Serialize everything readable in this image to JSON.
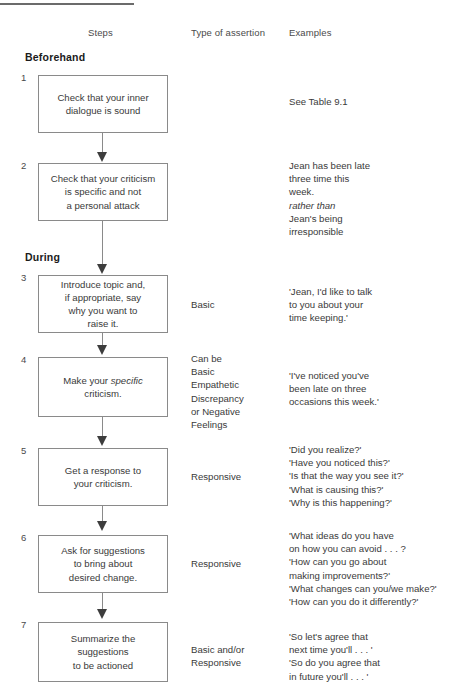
{
  "figure": {
    "columns": {
      "steps": "Steps",
      "type_of_assertion": "Type of assertion",
      "examples": "Examples"
    },
    "phases": {
      "beforehand": "Beforehand",
      "during": "During"
    },
    "steps": [
      {
        "number": "1",
        "box_lines": [
          "Check that your inner",
          "dialogue is sound"
        ],
        "assertion": "",
        "example_lines": [
          "See Table 9.1"
        ]
      },
      {
        "number": "2",
        "box_lines": [
          "Check that your criticism",
          "is specific and not",
          "a personal attack"
        ],
        "assertion": "",
        "example_lines": [
          "Jean has been late",
          "three time this",
          "week.",
          "rather than",
          "Jean's being",
          "irresponsible"
        ],
        "example_italic_lines": [
          "rather than"
        ]
      },
      {
        "number": "3",
        "box_lines": [
          "Introduce topic and,",
          "if appropriate, say",
          "why you want to",
          "raise it."
        ],
        "assertion": "Basic",
        "example_lines": [
          "'Jean, I'd like to talk",
          "to you about your",
          "time keeping.'"
        ]
      },
      {
        "number": "4",
        "box_lines": [
          "Make your specific",
          "criticism."
        ],
        "box_italic_words": [
          "specific"
        ],
        "assertion_lines": [
          "Can be",
          "Basic",
          "Empathetic",
          "Discrepancy",
          "or Negative",
          "Feelings"
        ],
        "example_lines": [
          "'I've noticed you've",
          "been late on three",
          "occasions this week.'"
        ]
      },
      {
        "number": "5",
        "box_lines": [
          "Get a response to",
          "your criticism."
        ],
        "assertion": "Responsive",
        "example_lines": [
          "'Did you realize?'",
          "'Have you noticed this?'",
          "'Is that the way you see it?'",
          "'What is causing this?'",
          "'Why is this happening?'"
        ]
      },
      {
        "number": "6",
        "box_lines": [
          "Ask for suggestions",
          "to bring about",
          "desired change."
        ],
        "assertion": "Responsive",
        "example_lines": [
          "'What ideas do you have",
          "on how you can avoid . . . ?",
          "'How can you go about",
          "making improvements?'",
          "'What changes can you/we make?'",
          "'How can you do it differently?'"
        ]
      },
      {
        "number": "7",
        "box_lines": [
          "Summarize the",
          "suggestions",
          "to be actioned"
        ],
        "assertion_lines": [
          "Basic and/or",
          "Responsive"
        ],
        "example_lines": [
          "'So let's agree that",
          "next time you'll . . . '",
          "'So do you agree that",
          "in future you'll . . . '"
        ]
      }
    ]
  },
  "colors": {
    "box_border": "#8a8a8a",
    "text": "#3a3a3a",
    "heading": "#1b1b1b",
    "rule": "#6b6b6b",
    "arrow": "#3d3d3d"
  }
}
